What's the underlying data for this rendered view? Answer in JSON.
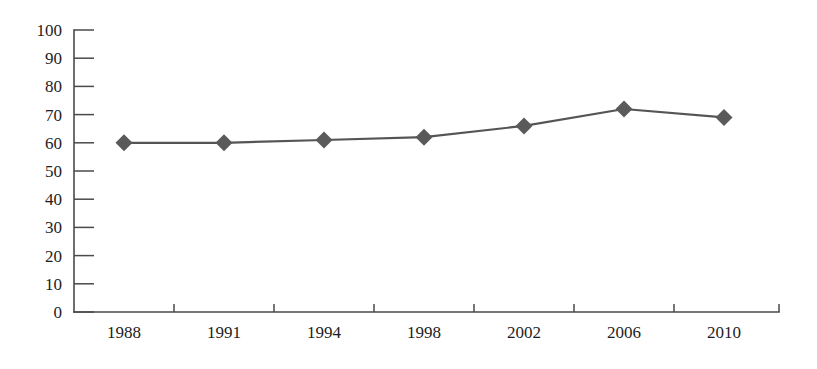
{
  "chart_data": {
    "type": "line",
    "title": "",
    "xlabel": "",
    "ylabel": "",
    "categories": [
      "1988",
      "1991",
      "1994",
      "1998",
      "2002",
      "2006",
      "2010"
    ],
    "values": [
      60,
      60,
      61,
      62,
      66,
      72,
      69
    ],
    "series": [
      {
        "name": "",
        "values": [
          60,
          60,
          61,
          62,
          66,
          72,
          69
        ]
      }
    ],
    "ylim": [
      0,
      100
    ],
    "ytick_labels": [
      "0",
      "10",
      "20",
      "30",
      "40",
      "50",
      "60",
      "70",
      "80",
      "90",
      "100"
    ],
    "ytick_values": [
      0,
      10,
      20,
      30,
      40,
      50,
      60,
      70,
      80,
      90,
      100
    ],
    "xtick_labels": [
      "1988",
      "1991",
      "1994",
      "1998",
      "2002",
      "2006",
      "2010"
    ],
    "grid": false,
    "legend": false,
    "legend_position": "none",
    "marker": "diamond",
    "colors": {
      "line": "#555555",
      "marker": "#5a5a5a",
      "axis": "#4a4a4a",
      "text": "#1d1d1d",
      "background": "#ffffff"
    }
  }
}
